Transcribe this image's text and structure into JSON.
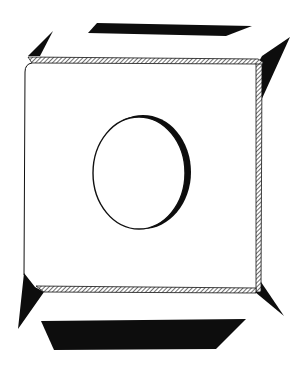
{
  "illustration": {
    "subject": "ink drawing of a square plate with a circular hole, with black cast shadows around its edges",
    "colors": {
      "background": "#ffffff",
      "ink": "#111111",
      "shadow": "#0d0d0d",
      "face": "#ffffff"
    }
  }
}
